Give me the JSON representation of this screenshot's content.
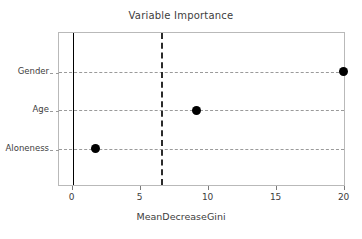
{
  "chart_data": {
    "type": "scatter",
    "title": "Variable Importance",
    "xlabel": "MeanDecreaseGini",
    "ylabel": "",
    "categories": [
      "Aloneness",
      "Age",
      "Gender"
    ],
    "values": [
      1.7,
      9.1,
      19.9
    ],
    "series": [
      {
        "name": "MeanDecreaseGini",
        "points": [
          {
            "category": "Gender",
            "value": 19.9
          },
          {
            "category": "Age",
            "value": 9.1
          },
          {
            "category": "Aloneness",
            "value": 1.7
          }
        ]
      }
    ],
    "xlim": [
      -1.0,
      20.1
    ],
    "xticks": [
      0,
      5,
      10,
      15,
      20
    ],
    "xtick_labels": [
      "0",
      "5",
      "10",
      "15",
      "20"
    ],
    "grid": "horizontal-dashed",
    "legend": "none",
    "reference_lines": [
      {
        "name": "zero-line",
        "value": 0,
        "style": "solid",
        "color": "#000000"
      },
      {
        "name": "threshold-line",
        "value": 6.5,
        "style": "dashed",
        "color": "#2b2b2b"
      }
    ],
    "marker": {
      "shape": "circle",
      "color": "#000000",
      "size": 9
    },
    "colors": {
      "marker": "#000000",
      "grid": "#9a9a9a",
      "panel_border": "#b9b9b9",
      "text": "#3d3d3d",
      "background": "#ffffff"
    }
  }
}
